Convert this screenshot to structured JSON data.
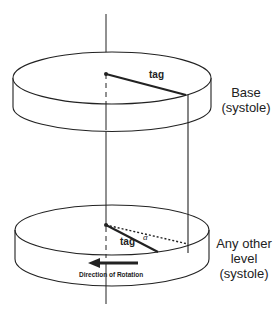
{
  "diagram": {
    "top_disc": {
      "tag_label": "tag",
      "label_line1": "Base",
      "label_line2": "(systole)"
    },
    "bottom_disc": {
      "tag_label": "tag",
      "angle_label": "α",
      "direction_label": "Direction of Rotation",
      "label_line1": "Any other",
      "label_line2": "level",
      "label_line3": "(systole)"
    },
    "colors": {
      "stroke": "#222222",
      "background": "#ffffff"
    }
  }
}
